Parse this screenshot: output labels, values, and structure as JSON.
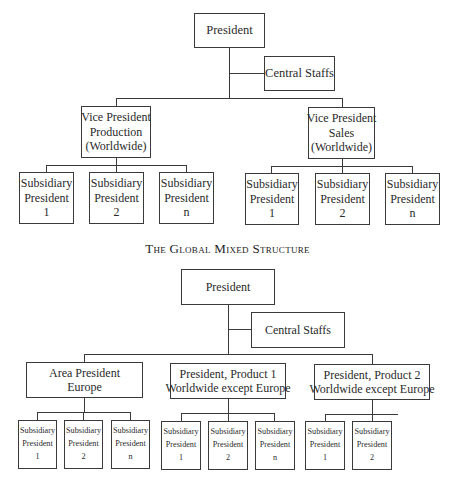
{
  "chart1": {
    "president": "President",
    "central_staffs": "Central Staffs",
    "vp_production": [
      "Vice President",
      "Production",
      "(Worldwide)"
    ],
    "vp_sales": [
      "Vice President",
      "Sales",
      "(Worldwide)"
    ],
    "production_subsidiaries": [
      [
        "Subsidiary",
        "President",
        "1"
      ],
      [
        "Subsidiary",
        "President",
        "2"
      ],
      [
        "Subsidiary",
        "President",
        "n"
      ]
    ],
    "sales_subsidiaries": [
      [
        "Subsidiary",
        "President",
        "1"
      ],
      [
        "Subsidiary",
        "President",
        "2"
      ],
      [
        "Subsidiary",
        "President",
        "n"
      ]
    ]
  },
  "title": "The Global Mixed Structure",
  "chart2": {
    "president": "President",
    "central_staffs": "Central Staffs",
    "area_president": [
      "Area President",
      "Europe"
    ],
    "product1_president": [
      "President, Product 1",
      "Worldwide except Europe"
    ],
    "product2_president": [
      "President, Product 2",
      "Worldwide except Europe"
    ],
    "area_subsidiaries": [
      [
        "Subsidiary",
        "President",
        "1"
      ],
      [
        "Subsidiary",
        "President",
        "2"
      ],
      [
        "Subsidiary",
        "President",
        "n"
      ]
    ],
    "product1_subsidiaries": [
      [
        "Subsidiary",
        "President",
        "1"
      ],
      [
        "Subsidiary",
        "President",
        "2"
      ],
      [
        "Subsidiary",
        "President",
        "n"
      ]
    ],
    "product2_subsidiaries": [
      [
        "Subsidiary",
        "President",
        "1"
      ],
      [
        "Subsidiary",
        "President",
        "2"
      ]
    ]
  }
}
